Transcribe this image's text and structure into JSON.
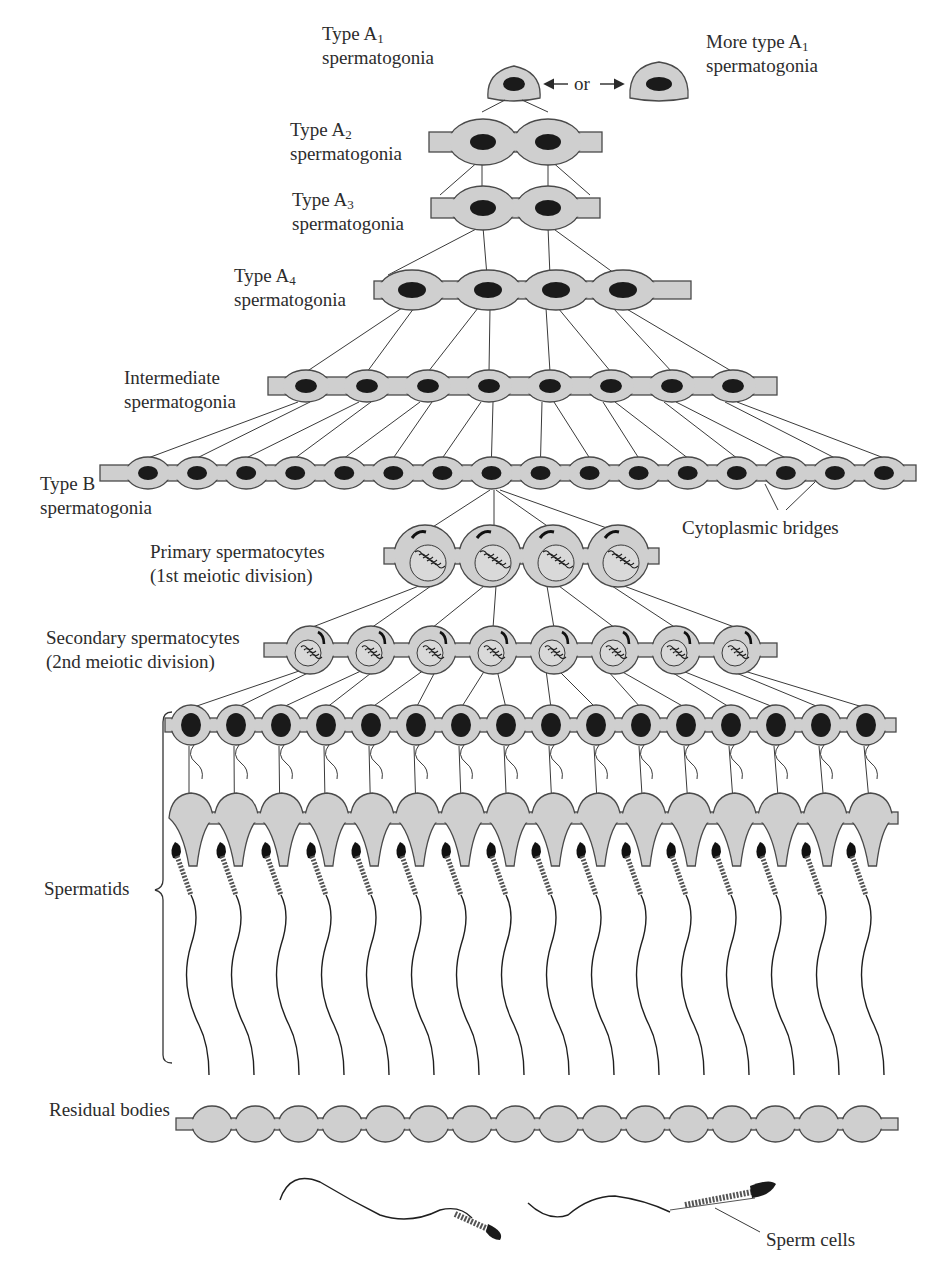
{
  "figure": {
    "stages": [
      {
        "id": "a1",
        "label_line1": "Type A",
        "sub": "1",
        "label_line2": "spermatogonia",
        "cell_count": 1
      },
      {
        "id": "a1_more",
        "label_line1": "More type A",
        "sub": "1",
        "label_line2": "spermatogonia",
        "cell_count": 1
      },
      {
        "id": "a2",
        "label_line1": "Type A",
        "sub": "2",
        "label_line2": "spermatogonia",
        "cell_count": 2
      },
      {
        "id": "a3",
        "label_line1": "Type A",
        "sub": "3",
        "label_line2": "spermatogonia",
        "cell_count": 2
      },
      {
        "id": "a4",
        "label_line1": "Type A",
        "sub": "4",
        "label_line2": "spermatogonia",
        "cell_count": 4
      },
      {
        "id": "intermediate",
        "label_line1": "Intermediate",
        "label_line2": "spermatogonia",
        "cell_count": 8
      },
      {
        "id": "typeb",
        "label_line1": "Type B",
        "label_line2": "spermatogonia",
        "cell_count": 16
      },
      {
        "id": "primary",
        "label_line1": "Primary spermatocytes",
        "label_line2": "(1st meiotic division)",
        "cell_count": 4
      },
      {
        "id": "secondary",
        "label_line1": "Secondary spermatocytes",
        "label_line2": "(2nd meiotic division)",
        "cell_count": 8
      },
      {
        "id": "spermatids",
        "label_line1": "Spermatids",
        "cell_count": 16
      },
      {
        "id": "residual",
        "label_line1": "Residual bodies",
        "cell_count": 16
      },
      {
        "id": "sperm",
        "label_line1": "Sperm cells",
        "cell_count": 2
      }
    ],
    "or_label": "or",
    "bridges_label": "Cytoplasmic bridges"
  },
  "colors": {
    "cytoplasm": "#cfcfcf",
    "outline": "#4a4a4a",
    "nucleus": "#1a1a1a",
    "text": "#2c2c2c"
  }
}
